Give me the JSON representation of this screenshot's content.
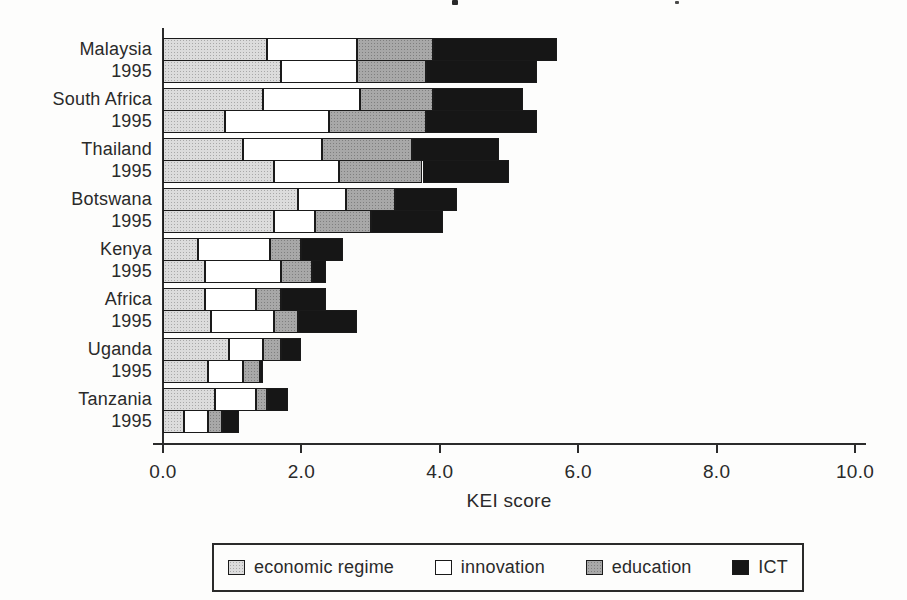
{
  "figure": {
    "background_color": "#fdfdfc",
    "border_color": "#1a1a1a"
  },
  "chart_data": {
    "type": "bar",
    "orientation": "horizontal",
    "stacked": true,
    "title": "",
    "xlabel": "KEI score",
    "xlim": [
      0,
      10
    ],
    "xticks": [
      "0.0",
      "2.0",
      "4.0",
      "6.0",
      "8.0",
      "10.0"
    ],
    "grid": false,
    "components": [
      "economic regime",
      "innovation",
      "education",
      "ICT"
    ],
    "colors": {
      "economic regime": "#dcdcdc",
      "innovation": "#ffffff",
      "education": "#a8a8a8",
      "ICT": "#161616"
    },
    "groups": [
      {
        "label_line1": "Malaysia",
        "label_line2": "1995",
        "bars": [
          [
            1.5,
            1.3,
            1.1,
            1.8
          ],
          [
            1.7,
            1.1,
            1.0,
            1.6
          ]
        ],
        "totals": [
          5.7,
          5.4
        ]
      },
      {
        "label_line1": "South Africa",
        "label_line2": "1995",
        "bars": [
          [
            1.45,
            1.4,
            1.05,
            1.3
          ],
          [
            0.9,
            1.5,
            1.4,
            1.6
          ]
        ],
        "totals": [
          5.2,
          5.4
        ]
      },
      {
        "label_line1": "Thailand",
        "label_line2": "1995",
        "bars": [
          [
            1.15,
            1.15,
            1.3,
            1.25
          ],
          [
            1.6,
            0.95,
            1.2,
            1.25
          ]
        ],
        "totals": [
          4.85,
          5.0
        ]
      },
      {
        "label_line1": "Botswana",
        "label_line2": "1995",
        "bars": [
          [
            1.95,
            0.7,
            0.7,
            0.9
          ],
          [
            1.6,
            0.6,
            0.8,
            1.05
          ]
        ],
        "totals": [
          4.25,
          4.05
        ]
      },
      {
        "label_line1": "Kenya",
        "label_line2": "1995",
        "bars": [
          [
            0.5,
            1.05,
            0.45,
            0.6
          ],
          [
            0.6,
            1.1,
            0.45,
            0.2
          ]
        ],
        "totals": [
          2.6,
          2.35
        ]
      },
      {
        "label_line1": "Africa",
        "label_line2": "1995",
        "bars": [
          [
            0.6,
            0.75,
            0.35,
            0.65
          ],
          [
            0.7,
            0.9,
            0.35,
            0.85
          ]
        ],
        "totals": [
          2.35,
          2.8
        ]
      },
      {
        "label_line1": "Uganda",
        "label_line2": "1995",
        "bars": [
          [
            0.95,
            0.5,
            0.25,
            0.3
          ],
          [
            0.65,
            0.5,
            0.25,
            0.05
          ]
        ],
        "totals": [
          2.0,
          1.45
        ]
      },
      {
        "label_line1": "Tanzania",
        "label_line2": "1995",
        "bars": [
          [
            0.75,
            0.6,
            0.15,
            0.3
          ],
          [
            0.3,
            0.35,
            0.2,
            0.25
          ]
        ],
        "totals": [
          1.8,
          1.1
        ]
      }
    ],
    "legend": {
      "position": "bottom",
      "boxed": true,
      "entries": [
        "economic regime",
        "innovation",
        "education",
        "ICT"
      ]
    }
  }
}
